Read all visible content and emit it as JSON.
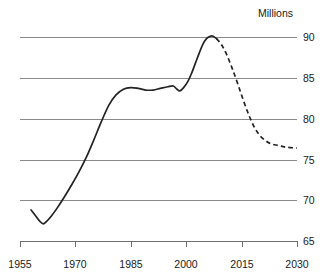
{
  "chart_data": {
    "type": "line",
    "title": "",
    "ylabel": "Millions",
    "xlabel": "",
    "xlim": [
      1955,
      2030
    ],
    "ylim": [
      65,
      90
    ],
    "grid": true,
    "legend": "none",
    "x_ticks": [
      "1955",
      "1970",
      "1985",
      "2000",
      "2015",
      "2030"
    ],
    "x_tick_values": [
      1955,
      1970,
      1985,
      2000,
      2015,
      2030
    ],
    "y_ticks": [
      "65",
      "70",
      "75",
      "80",
      "85",
      "90"
    ],
    "y_tick_values": [
      65,
      70,
      75,
      80,
      85,
      90
    ],
    "series": [
      {
        "name": "observed",
        "style": "solid",
        "points": [
          [
            1958.0,
            68.8
          ],
          [
            1959.2,
            68.1
          ],
          [
            1960.4,
            67.4
          ],
          [
            1961.3,
            67.1
          ],
          [
            1962.2,
            67.4
          ],
          [
            1963.4,
            68.0
          ],
          [
            1965.0,
            69.0
          ],
          [
            1967.0,
            70.4
          ],
          [
            1969.0,
            71.9
          ],
          [
            1971.0,
            73.5
          ],
          [
            1973.0,
            75.3
          ],
          [
            1975.0,
            77.4
          ],
          [
            1977.0,
            79.6
          ],
          [
            1979.0,
            81.6
          ],
          [
            1981.0,
            82.9
          ],
          [
            1983.0,
            83.6
          ],
          [
            1985.0,
            83.8
          ],
          [
            1987.0,
            83.7
          ],
          [
            1989.0,
            83.5
          ],
          [
            1991.0,
            83.5
          ],
          [
            1993.0,
            83.7
          ],
          [
            1995.0,
            83.9
          ],
          [
            1996.5,
            84.0
          ],
          [
            1997.5,
            83.6
          ],
          [
            1998.3,
            83.4
          ],
          [
            1999.3,
            83.8
          ],
          [
            2000.5,
            84.6
          ],
          [
            2001.5,
            85.6
          ],
          [
            2002.5,
            86.8
          ],
          [
            2003.5,
            88.0
          ],
          [
            2004.5,
            89.1
          ],
          [
            2005.5,
            89.8
          ],
          [
            2006.5,
            90.1
          ],
          [
            2007.3,
            90.1
          ],
          [
            2008.2,
            89.8
          ]
        ]
      },
      {
        "name": "projected",
        "style": "dashed",
        "points": [
          [
            2008.2,
            89.8
          ],
          [
            2009.5,
            89.1
          ],
          [
            2011.0,
            87.8
          ],
          [
            2012.5,
            86.1
          ],
          [
            2014.0,
            84.2
          ],
          [
            2015.5,
            82.2
          ],
          [
            2017.0,
            80.4
          ],
          [
            2018.5,
            78.9
          ],
          [
            2020.0,
            77.9
          ],
          [
            2021.5,
            77.3
          ],
          [
            2023.0,
            76.9
          ],
          [
            2025.0,
            76.7
          ],
          [
            2027.0,
            76.5
          ],
          [
            2030.0,
            76.4
          ]
        ]
      }
    ]
  },
  "labels": {
    "unit_title": "Millions",
    "x_1955": "1955",
    "x_1970": "1970",
    "x_1985": "1985",
    "x_2000": "2000",
    "x_2015": "2015",
    "x_2030": "2030",
    "y_90": "90",
    "y_85": "85",
    "y_80": "80",
    "y_75": "75",
    "y_70": "70",
    "y_65": "65"
  }
}
